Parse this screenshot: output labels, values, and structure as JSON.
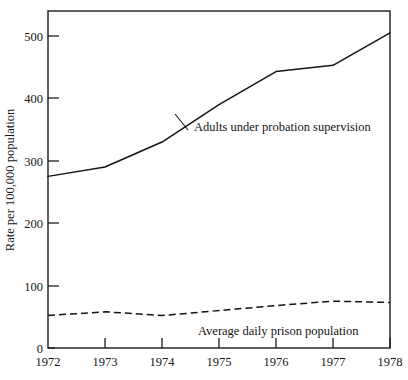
{
  "chart_data": {
    "type": "line",
    "title": "",
    "subtitle": "",
    "xlabel": "",
    "ylabel": "Rate per 100,000 population",
    "x": [
      1972,
      1973,
      1974,
      1975,
      1976,
      1977,
      1978
    ],
    "categories": [
      "1972",
      "1973",
      "1974",
      "1975",
      "1976",
      "1977",
      "1978"
    ],
    "xlim": [
      1972,
      1978
    ],
    "ylim": [
      0,
      540
    ],
    "yticks": [
      0,
      100,
      200,
      300,
      400,
      500
    ],
    "ytick_labels": [
      "0",
      "100",
      "200",
      "300",
      "400",
      "500"
    ],
    "xticks": [
      1972,
      1973,
      1974,
      1975,
      1976,
      1977,
      1978
    ],
    "xtick_labels": [
      "1972",
      "1973",
      "1974",
      "1975",
      "1976",
      "1977",
      "1978"
    ],
    "grid": false,
    "legend_position": "inline-annotation",
    "series": [
      {
        "name": "Adults under probation supervision",
        "style": "solid",
        "color": "#141414",
        "values": [
          275,
          290,
          330,
          390,
          443,
          453,
          505
        ]
      },
      {
        "name": "Average daily prison population",
        "style": "dashed",
        "color": "#141414",
        "values": [
          52,
          58,
          52,
          60,
          68,
          75,
          73
        ]
      }
    ],
    "annotations": [
      {
        "text": "Adults under probation supervision",
        "series": "Adults under probation supervision",
        "x_px": 194,
        "y_px": 131
      },
      {
        "text": "Average daily prison population",
        "series": "Average daily prison population",
        "x_px": 198,
        "y_px": 335
      }
    ]
  },
  "axes": {
    "y_title": "Rate per 100,000 population",
    "y_tick_labels": [
      "500",
      "400",
      "300",
      "200",
      "100",
      "0"
    ],
    "x_tick_labels": [
      "1972",
      "1973",
      "1974",
      "1975",
      "1976",
      "1977",
      "1978"
    ]
  },
  "annotations": {
    "probation_label": "Adults under probation supervision",
    "prison_label": "Average daily prison population"
  }
}
